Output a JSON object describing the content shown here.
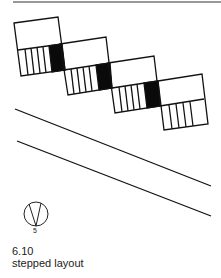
{
  "figure": {
    "number": "6.10",
    "caption": "stepped layout",
    "compass": {
      "label": "5",
      "icon": "north-arrow-icon"
    },
    "colors": {
      "line": "#111111",
      "fill_black": "#0a0a0a",
      "background": "#ffffff"
    },
    "blocks": [
      {
        "id": 1,
        "corners": {
          "tl": [
            14,
            23
          ],
          "tr": [
            58,
            17
          ],
          "ml": [
            18,
            50
          ],
          "mr": [
            62,
            44
          ],
          "bl": [
            21,
            76
          ],
          "br": [
            65,
            70
          ]
        }
      },
      {
        "id": 2,
        "corners": {
          "tl": [
            60,
            44
          ],
          "tr": [
            106,
            37
          ],
          "ml": [
            64,
            70
          ],
          "mr": [
            110,
            63
          ],
          "bl": [
            68,
            95
          ],
          "br": [
            112,
            88
          ]
        }
      },
      {
        "id": 3,
        "corners": {
          "tl": [
            108,
            63
          ],
          "tr": [
            154,
            56
          ],
          "ml": [
            112,
            88
          ],
          "mr": [
            158,
            81
          ],
          "bl": [
            115,
            113
          ],
          "br": [
            160,
            106
          ]
        }
      },
      {
        "id": 4,
        "corners": {
          "tl": [
            158,
            81
          ],
          "tr": [
            202,
            74
          ],
          "ml": [
            160,
            106
          ],
          "mr": [
            204,
            99
          ],
          "bl": [
            164,
            130
          ],
          "br": [
            208,
            124
          ]
        }
      }
    ],
    "road_lines": [
      {
        "from": [
          15,
          109
        ],
        "to": [
          211,
          186
        ]
      },
      {
        "from": [
          17,
          141
        ],
        "to": [
          211,
          216
        ]
      }
    ],
    "top_rule": {
      "from": [
        13,
        2
      ],
      "to": [
        221,
        2
      ]
    }
  }
}
